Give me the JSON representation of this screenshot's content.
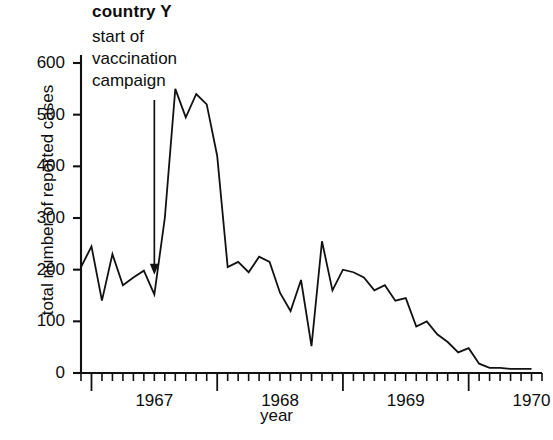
{
  "chart_data": {
    "type": "line",
    "title": "country Y",
    "xlabel": "year",
    "ylabel": "total number of reported cases",
    "ylim": [
      0,
      600
    ],
    "yticks": [
      0,
      100,
      200,
      300,
      400,
      500,
      600
    ],
    "xtick_labels": [
      "1967",
      "1968",
      "1969",
      "1970"
    ],
    "x_tick_interval": "month",
    "grid": false,
    "legend": null,
    "annotations": [
      {
        "name": "start-of-vaccination-campaign",
        "text_lines": [
          "start of",
          "vaccination",
          "campaign"
        ],
        "arrow": "down",
        "points_to_x": "1967-07",
        "points_to_y": 190
      }
    ],
    "series": [
      {
        "name": "total reported cases",
        "color": "#111111",
        "x": [
          "1966-12",
          "1967-01",
          "1967-02",
          "1967-03",
          "1967-04",
          "1967-05",
          "1967-06",
          "1967-07",
          "1967-08",
          "1967-09",
          "1967-10",
          "1967-11",
          "1967-12",
          "1968-01",
          "1968-02",
          "1968-03",
          "1968-04",
          "1968-05",
          "1968-06",
          "1968-07",
          "1968-08",
          "1968-09",
          "1968-10",
          "1968-11",
          "1968-12",
          "1969-01",
          "1969-02",
          "1969-03",
          "1969-04",
          "1969-05",
          "1969-06",
          "1969-07",
          "1969-08",
          "1969-09",
          "1969-10",
          "1969-11",
          "1969-12",
          "1970-01",
          "1970-02",
          "1970-03",
          "1970-04",
          "1970-05",
          "1970-06",
          "1970-07"
        ],
        "values": [
          205,
          245,
          140,
          230,
          170,
          185,
          198,
          152,
          300,
          550,
          495,
          540,
          520,
          420,
          205,
          215,
          195,
          225,
          215,
          155,
          120,
          180,
          52,
          255,
          160,
          200,
          195,
          185,
          160,
          170,
          140,
          145,
          90,
          100,
          75,
          60,
          40,
          48,
          18,
          10,
          10,
          8,
          8,
          8
        ]
      }
    ]
  }
}
